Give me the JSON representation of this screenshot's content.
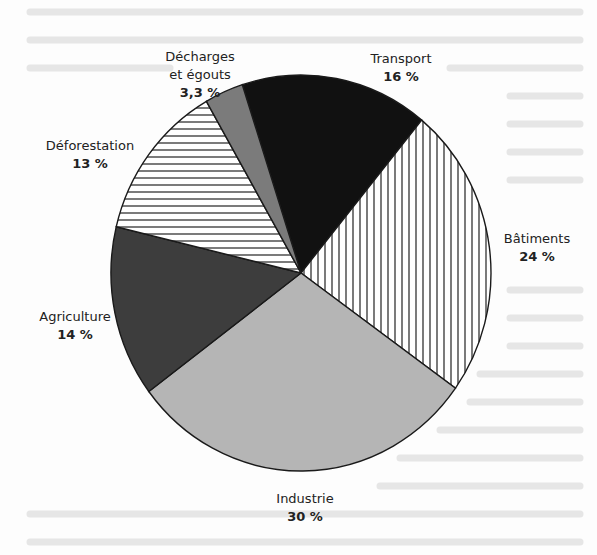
{
  "chart_data": {
    "type": "pie",
    "title": "",
    "categories": [
      "Transport",
      "Bâtiments",
      "Industrie",
      "Agriculture",
      "Déforestation",
      "Décharges et égouts"
    ],
    "values": [
      16,
      24,
      30,
      14,
      13,
      3.3
    ],
    "unit": "%",
    "fills": [
      "solid-black",
      "vertical-hatch",
      "light-gray",
      "dark-gray",
      "horizontal-hatch",
      "medium-gray"
    ],
    "colors": [
      "#111111",
      "#ffffff",
      "#b4b4b4",
      "#3c3c3c",
      "#ffffff",
      "#7a7a7a"
    ],
    "legend": "none (direct labels)"
  },
  "labels": [
    {
      "name": "Transport",
      "pct": "16 %"
    },
    {
      "name": "Bâtiments",
      "pct": "24 %"
    },
    {
      "name": "Industrie",
      "pct": "30 %"
    },
    {
      "name": "Agriculture",
      "pct": "14 %"
    },
    {
      "name": "Déforestation",
      "pct": "13 %"
    },
    {
      "name_line1": "Décharges",
      "name_line2": "et égouts",
      "pct": "3,3 %"
    }
  ]
}
